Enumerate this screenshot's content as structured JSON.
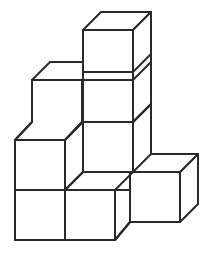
{
  "figure": {
    "description": "Line drawing of seven identical cubes arranged in a staircase pattern on an isometric grid",
    "cube_count": 7,
    "line_color": "#2a2a2a",
    "fill_color": "#ffffff",
    "background_color": "#ffffff",
    "stroke_width": 2,
    "canvas": {
      "width": 212,
      "height": 253
    },
    "projection": {
      "type": "isometric",
      "cube_edge_px": 50,
      "depth_dx_px": -18,
      "depth_dy_px": -18,
      "origin_x": 65,
      "origin_y": 240
    },
    "cubes": [
      {
        "id": "cube-bottom-left",
        "grid": [
          0,
          0,
          0
        ],
        "label": "bottom row left cube"
      },
      {
        "id": "cube-bottom-center",
        "grid": [
          1,
          0,
          0
        ],
        "label": "bottom row center cube"
      },
      {
        "id": "cube-bottom-right-front",
        "grid": [
          2,
          0,
          0
        ],
        "label": "bottom row right front cube"
      },
      {
        "id": "cube-middle-left",
        "grid": [
          0,
          0,
          1
        ],
        "label": "second level left cube"
      },
      {
        "id": "cube-middle-center",
        "grid": [
          1,
          0,
          1
        ],
        "label": "second level center cube"
      },
      {
        "id": "cube-upper-left",
        "grid": [
          0,
          0,
          2
        ],
        "label": "third level left cube"
      },
      {
        "id": "cube-top-center",
        "grid": [
          1,
          0,
          3
        ],
        "label": "top center cube"
      }
    ],
    "faces": [
      {
        "name": "top-cube-top-face",
        "type": "top"
      },
      {
        "name": "top-cube-front-face",
        "type": "front"
      },
      {
        "name": "top-cube-right-face",
        "type": "right"
      },
      {
        "name": "column-front-face-level3",
        "type": "front"
      },
      {
        "name": "column-right-face-level3",
        "type": "right"
      },
      {
        "name": "column-front-face-level2",
        "type": "front"
      },
      {
        "name": "column-right-face-level2",
        "type": "right"
      },
      {
        "name": "upper-left-top-face",
        "type": "top"
      },
      {
        "name": "upper-left-front-face",
        "type": "front"
      },
      {
        "name": "middle-left-top-face",
        "type": "top"
      },
      {
        "name": "middle-left-front-face",
        "type": "front"
      },
      {
        "name": "bottom-left-front-face",
        "type": "front"
      },
      {
        "name": "bottom-center-front-face",
        "type": "front"
      },
      {
        "name": "right-cube-top-face",
        "type": "top"
      },
      {
        "name": "right-cube-front-face",
        "type": "front"
      },
      {
        "name": "right-cube-right-face",
        "type": "right"
      }
    ]
  }
}
